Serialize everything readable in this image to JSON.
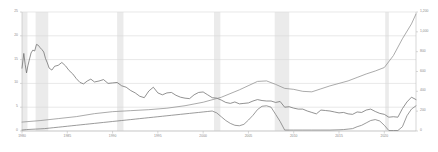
{
  "chart_data": {
    "type": "line",
    "title": "",
    "subtitle": "",
    "xlabel": "",
    "ylabel": "",
    "grid": true,
    "legend_position": "none",
    "x_range": [
      1980,
      2023.5
    ],
    "xticks": [
      1980,
      1985,
      1990,
      1995,
      2000,
      2005,
      2010,
      2015,
      2020
    ],
    "xtick_labels": [
      "1980",
      "1985",
      "1990",
      "1995",
      "2000",
      "2005",
      "2010",
      "2015",
      "2020"
    ],
    "left_axis": {
      "ylim": [
        0,
        25
      ],
      "yticks": [
        0,
        5,
        10,
        15,
        20,
        25
      ],
      "ytick_labels": [
        "0",
        "5",
        "10",
        "15",
        "20",
        "25"
      ]
    },
    "right_axis": {
      "ylim": [
        0,
        1200
      ],
      "yticks": [
        0,
        200,
        400,
        600,
        800,
        1000,
        1200
      ],
      "ytick_labels": [
        "0",
        "200",
        "400",
        "600",
        "800",
        "1,000",
        "1,200"
      ]
    },
    "shaded_bands": [
      {
        "label": "recession",
        "x0": 1980.0,
        "x1": 1980.6
      },
      {
        "label": "recession",
        "x0": 1981.5,
        "x1": 1982.9
      },
      {
        "label": "recession",
        "x0": 1990.5,
        "x1": 1991.2
      },
      {
        "label": "recession",
        "x0": 2001.2,
        "x1": 2001.9
      },
      {
        "label": "recession",
        "x0": 2007.9,
        "x1": 2009.5
      },
      {
        "label": "recession",
        "x0": 2020.1,
        "x1": 2020.5
      }
    ],
    "series": [
      {
        "name": "mortgage-rate",
        "axis": "left",
        "color": "#6e6e6e",
        "x": [
          1980.0,
          1980.2,
          1980.35,
          1980.5,
          1980.65,
          1980.8,
          1981.0,
          1981.2,
          1981.4,
          1981.6,
          1981.8,
          1982.0,
          1982.2,
          1982.4,
          1982.6,
          1982.8,
          1983.0,
          1983.3,
          1983.6,
          1984.0,
          1984.4,
          1984.8,
          1985.2,
          1985.6,
          1986.0,
          1986.4,
          1986.8,
          1987.2,
          1987.6,
          1988.0,
          1988.5,
          1989.0,
          1989.5,
          1990.0,
          1990.5,
          1991.0,
          1991.5,
          1992.0,
          1992.5,
          1993.0,
          1993.5,
          1994.0,
          1994.5,
          1995.0,
          1995.5,
          1996.0,
          1996.5,
          1997.0,
          1997.5,
          1998.0,
          1998.5,
          1999.0,
          1999.5,
          2000.0,
          2000.5,
          2001.0,
          2001.5,
          2002.0,
          2002.5,
          2003.0,
          2003.5,
          2004.0,
          2004.5,
          2005.0,
          2005.5,
          2006.0,
          2006.5,
          2007.0,
          2007.5,
          2008.0,
          2008.5,
          2009.0,
          2009.5,
          2010.0,
          2010.5,
          2011.0,
          2011.5,
          2012.0,
          2012.5,
          2013.0,
          2013.5,
          2014.0,
          2014.5,
          2015.0,
          2015.5,
          2016.0,
          2016.5,
          2017.0,
          2017.5,
          2018.0,
          2018.5,
          2019.0,
          2019.5,
          2020.0,
          2020.5,
          2021.0,
          2021.5,
          2022.0,
          2022.5,
          2023.0,
          2023.5
        ],
        "y": [
          13.2,
          16.3,
          14.0,
          12.2,
          13.7,
          14.9,
          16.4,
          17.0,
          16.8,
          18.2,
          18.0,
          17.5,
          17.1,
          16.6,
          15.2,
          14.3,
          13.2,
          12.8,
          13.6,
          13.8,
          14.4,
          13.7,
          12.7,
          12.0,
          11.0,
          10.2,
          9.9,
          10.5,
          10.9,
          10.3,
          10.5,
          10.8,
          10.0,
          10.1,
          10.2,
          9.5,
          9.2,
          8.5,
          8.0,
          7.3,
          7.0,
          8.4,
          9.2,
          8.0,
          7.6,
          8.0,
          8.1,
          7.5,
          7.1,
          6.9,
          6.8,
          7.6,
          8.1,
          8.2,
          7.6,
          7.0,
          6.9,
          6.5,
          6.0,
          5.8,
          6.1,
          5.7,
          5.8,
          5.9,
          6.3,
          6.6,
          6.4,
          6.3,
          6.3,
          6.0,
          6.2,
          5.0,
          5.1,
          4.8,
          4.6,
          4.6,
          4.2,
          3.9,
          3.6,
          4.4,
          4.3,
          4.2,
          4.0,
          3.8,
          3.9,
          3.6,
          3.5,
          4.0,
          3.9,
          4.4,
          4.6,
          4.1,
          3.7,
          3.5,
          2.9,
          3.0,
          2.9,
          4.7,
          6.1,
          7.1,
          6.6
        ],
        "note": "high-volatility series with spikes, left axis, percent"
      },
      {
        "name": "policy-rate",
        "axis": "left",
        "color": "#7a7a7a",
        "x": [
          1980.0,
          1980.5,
          1981.0,
          1981.5,
          1982.0,
          1982.5,
          1983.0,
          1983.5,
          1984.0,
          1984.5,
          1985.0,
          1985.5,
          1986.0,
          1986.5,
          1987.0,
          1987.5,
          1988.0,
          1988.5,
          1989.0,
          1989.5,
          1990.0,
          1990.5,
          1991.0,
          1991.5,
          1992.0,
          1992.5,
          1993.0,
          1993.5,
          1994.0,
          1994.5,
          1995.0,
          1995.5,
          1996.0,
          1996.5,
          1997.0,
          1997.5,
          1998.0,
          1998.5,
          1999.0,
          1999.5,
          2000.0,
          2000.5,
          2001.0,
          2001.5,
          2002.0,
          2002.5,
          2003.0,
          2003.5,
          2004.0,
          2004.5,
          2005.0,
          2005.5,
          2006.0,
          2006.5,
          2007.0,
          2007.5,
          2008.0,
          2008.5,
          2009.0,
          2010.0,
          2011.0,
          2012.0,
          2013.0,
          2014.0,
          2015.0,
          2015.5,
          2016.0,
          2016.5,
          2017.0,
          2017.5,
          2018.0,
          2018.5,
          2019.0,
          2019.5,
          2020.0,
          2020.5,
          2021.0,
          2021.5,
          2022.0,
          2022.5,
          2023.0,
          2023.5
        ],
        "y": [
          0.2,
          0.3,
          0.35,
          0.4,
          0.45,
          0.5,
          0.6,
          0.7,
          0.8,
          0.9,
          1.0,
          1.1,
          1.2,
          1.3,
          1.4,
          1.5,
          1.6,
          1.7,
          1.8,
          1.9,
          2.0,
          2.1,
          2.2,
          2.3,
          2.4,
          2.5,
          2.6,
          2.7,
          2.8,
          2.9,
          3.0,
          3.1,
          3.2,
          3.3,
          3.4,
          3.5,
          3.6,
          3.7,
          3.8,
          3.9,
          4.0,
          4.1,
          4.2,
          3.8,
          3.0,
          2.2,
          1.6,
          1.2,
          1.1,
          1.4,
          2.3,
          3.3,
          4.5,
          5.2,
          5.3,
          5.0,
          3.5,
          2.0,
          0.2,
          0.2,
          0.2,
          0.2,
          0.2,
          0.2,
          0.25,
          0.3,
          0.4,
          0.5,
          0.9,
          1.2,
          1.7,
          2.2,
          2.4,
          2.1,
          1.2,
          0.1,
          0.1,
          0.1,
          0.9,
          3.2,
          4.6,
          5.3
        ],
        "note": "smooth lower series rising through 1980s-90s then plunging after 2008"
      },
      {
        "name": "house-price-index",
        "axis": "right",
        "color": "#8f8f8f",
        "x": [
          1980,
          1982,
          1984,
          1986,
          1988,
          1990,
          1992,
          1994,
          1996,
          1998,
          2000,
          2002,
          2004,
          2006,
          2007,
          2008,
          2009,
          2010,
          2011,
          2012,
          2013,
          2014,
          2015,
          2016,
          2017,
          2018,
          2019,
          2020,
          2021,
          2022,
          2023,
          2023.5
        ],
        "y": [
          90,
          105,
          125,
          145,
          175,
          195,
          205,
          215,
          230,
          255,
          290,
          340,
          415,
          500,
          505,
          470,
          430,
          420,
          400,
          395,
          425,
          455,
          480,
          505,
          540,
          575,
          605,
          640,
          760,
          930,
          1080,
          1180
        ],
        "note": "smooth index series on right axis, steep rise 2020-2023"
      }
    ]
  },
  "axes": {
    "left_tick_labels": [
      "25",
      "20",
      "15",
      "10",
      "5",
      "0"
    ],
    "right_tick_labels": [
      "1,200",
      "1,000",
      "800",
      "600",
      "400",
      "200",
      "0"
    ],
    "x_tick_labels": [
      "1980",
      "1985",
      "1990",
      "1995",
      "2000",
      "2005",
      "2010",
      "2015",
      "2020"
    ]
  },
  "colors": {
    "background": "#ffffff",
    "gridline": "#d8d8d8",
    "axis_line": "#bdbdbd",
    "tick_text": "#8a8a8a",
    "band_fill": "#ebebeb",
    "series_dark": "#6e6e6e",
    "series_mid": "#7a7a7a",
    "series_light": "#8f8f8f"
  }
}
